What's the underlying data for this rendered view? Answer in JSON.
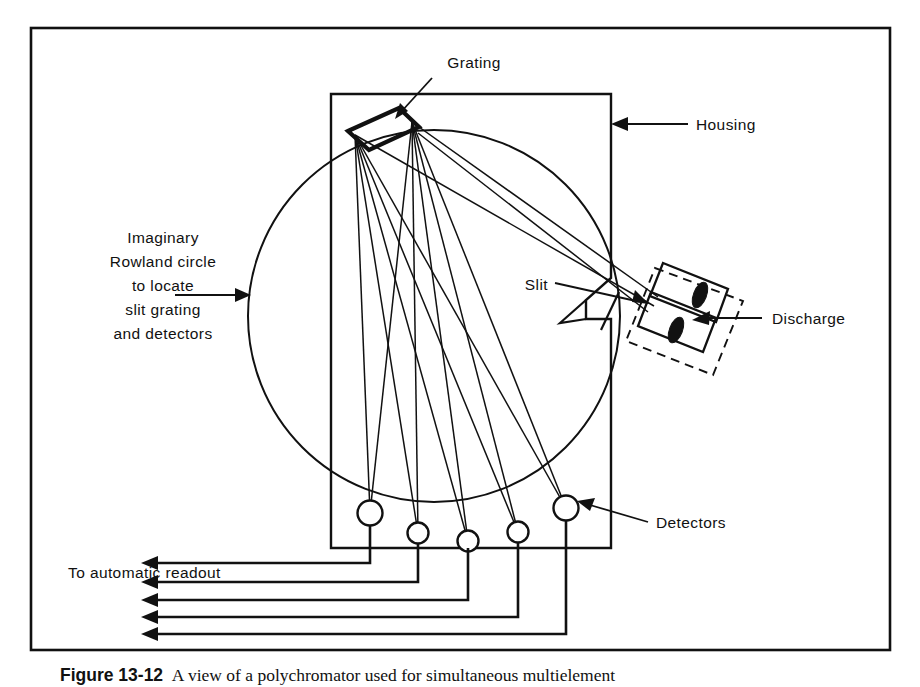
{
  "figure": {
    "labels": {
      "grating": "Grating",
      "housing": "Housing",
      "slit": "Slit",
      "discharge": "Discharge",
      "detectors": "Detectors",
      "readout": "To automatic readout",
      "rowland_line_1": "Imaginary",
      "rowland_line_2": "Rowland  circle",
      "rowland_line_3": "to locate",
      "rowland_line_4": "slit grating",
      "rowland_line_5": "and detectors"
    },
    "caption": {
      "number": "Figure 13-12",
      "text": "A view of a polychromator used for simultaneous multielement"
    },
    "colors": {
      "ink": "#111111",
      "background": "#ffffff"
    },
    "counts": {
      "detectors": 5,
      "readout_arrows": 5,
      "discharge_electrodes": 2
    }
  }
}
